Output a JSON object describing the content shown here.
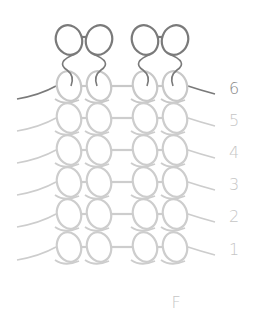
{
  "diagram": {
    "type": "stitch-row-diagram",
    "columns_x": [
      69,
      99,
      145,
      175
    ],
    "top_row": {
      "y": 40,
      "color": "#7a7a7a",
      "pairs": [
        [
          0,
          1
        ],
        [
          2,
          3
        ]
      ]
    },
    "rows": [
      {
        "label": "6",
        "y": 86,
        "color": "#c8c8c8",
        "label_color": "#8a8a8a"
      },
      {
        "label": "5",
        "y": 118,
        "color": "#cdcdcd",
        "label_color": "#c6c6c6"
      },
      {
        "label": "4",
        "y": 150,
        "color": "#cdcdcd",
        "label_color": "#c6c6c6"
      },
      {
        "label": "3",
        "y": 182,
        "color": "#cdcdcd",
        "label_color": "#c6c6c6"
      },
      {
        "label": "2",
        "y": 214,
        "color": "#cdcdcd",
        "label_color": "#c6c6c6"
      },
      {
        "label": "1",
        "y": 247,
        "color": "#cdcdcd",
        "label_color": "#c6c6c6"
      }
    ],
    "lead_line_color_dark": "#7a7a7a",
    "footer_label": "F",
    "footer_label_color": "#c6c6c6"
  }
}
